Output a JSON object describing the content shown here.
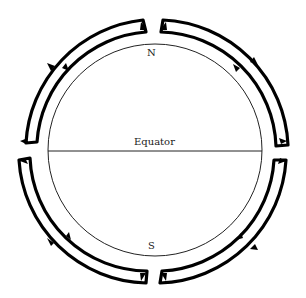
{
  "diagram": {
    "type": "atmospheric-circulation-cells",
    "labels": {
      "north": "N",
      "south": "S",
      "equator": "Equator"
    },
    "colors": {
      "loop_stroke": "#000000",
      "globe_stroke": "#222222",
      "background": "#ffffff"
    },
    "cells": [
      {
        "quadrant": "north-west",
        "flow": "rises at equator, flows poleward aloft, descends at pole, returns equatorward at surface"
      },
      {
        "quadrant": "north-east",
        "flow": "rises at equator, flows poleward aloft, descends at pole, returns equatorward at surface"
      },
      {
        "quadrant": "south-west",
        "flow": "rises at equator, flows poleward aloft, descends at pole, returns equatorward at surface"
      },
      {
        "quadrant": "south-east",
        "flow": "rises at equator, flows poleward aloft, descends at pole, returns equatorward at surface"
      }
    ]
  }
}
